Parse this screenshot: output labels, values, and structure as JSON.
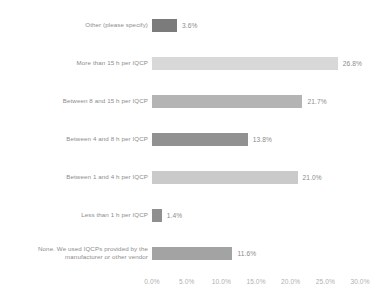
{
  "chart_data": {
    "type": "bar",
    "orientation": "horizontal",
    "title": "",
    "xlabel": "",
    "ylabel": "",
    "xlim": [
      0.0,
      30.0
    ],
    "xticks": [
      "0.0%",
      "5.0%",
      "10.0%",
      "15.0%",
      "20.0%",
      "25.0%",
      "30.0%"
    ],
    "xtick_values": [
      0.0,
      5.0,
      10.0,
      15.0,
      20.0,
      25.0,
      30.0
    ],
    "grid": false,
    "legend": "none",
    "categories": [
      "Other (please specify)",
      "More than 15 h per IQCP",
      "Between 8 and 15 h per IQCP",
      "Between 4 and 8 h per IQCP",
      "Between 1 and 4 h per IQCP",
      "Less than 1 h per IQCP",
      "None. We used IQCPs provided by the\nmanufacturer or other vendor"
    ],
    "values": [
      3.6,
      26.8,
      21.7,
      13.8,
      21.0,
      1.4,
      11.6
    ],
    "value_labels": [
      "3.6%",
      "26.8%",
      "21.7%",
      "13.8%",
      "21.0%",
      "1.4%",
      "11.6%"
    ],
    "bar_colors": [
      "#7b7b7b",
      "#d8d8d8",
      "#b4b4b4",
      "#919191",
      "#cacaca",
      "#8f8f8f",
      "#a3a3a3"
    ]
  },
  "axis": {
    "tick_color": "#b0b0b0"
  },
  "style": {
    "label_color": "#8c8c8c",
    "background": "#ffffff"
  }
}
